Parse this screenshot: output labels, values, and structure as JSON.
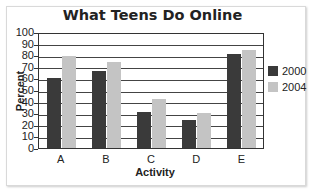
{
  "chart_data": {
    "type": "bar",
    "title": "What Teens Do Online",
    "xlabel": "Activity",
    "ylabel": "Percent",
    "categories": [
      "A",
      "B",
      "C",
      "D",
      "E"
    ],
    "series": [
      {
        "name": "2000",
        "color": "#3a3a3a",
        "values": [
          61,
          67,
          32,
          25,
          82
        ]
      },
      {
        "name": "2004",
        "color": "#c4c4c4",
        "values": [
          80,
          75,
          43,
          31,
          85
        ]
      }
    ],
    "ylim": [
      0,
      100
    ],
    "yticks": [
      "0",
      "10",
      "20",
      "30",
      "40",
      "50",
      "60",
      "70",
      "80",
      "90",
      "100"
    ],
    "grid": true,
    "legend_position": "right"
  }
}
